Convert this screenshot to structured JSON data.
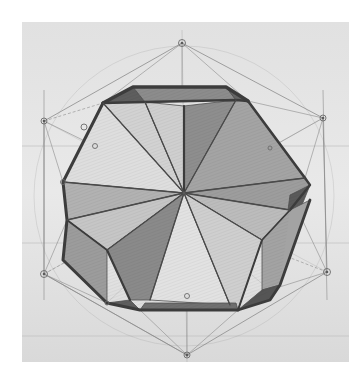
{
  "image": {
    "subject": "Pencil drawing of a dodecahedron with geometric construction lines",
    "caption_fragment": "· · · · · ·",
    "colors": {
      "paper": "#e3e3e3",
      "paper_light": "#ededed",
      "construction_line": "#8c8c8c",
      "edge_dark": "#3f3f3f",
      "shade_dark": "#6d6d6d",
      "shade_mid": "#9a9a9a",
      "shade_light": "#c4c4c4",
      "highlight": "#dcdcdc"
    }
  }
}
